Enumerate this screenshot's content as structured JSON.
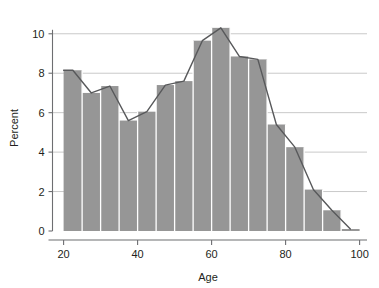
{
  "chart_data": {
    "type": "bar",
    "title": "",
    "subtitle": "",
    "xlabel": "Age",
    "ylabel": "Percent",
    "xlim": [
      17,
      102
    ],
    "ylim": [
      0,
      10.8
    ],
    "grid": true,
    "legend_position": "none",
    "bin_width": 5,
    "bin_edges": [
      20,
      25,
      30,
      35,
      40,
      45,
      50,
      55,
      60,
      65,
      70,
      75,
      80,
      85,
      90,
      95,
      100
    ],
    "categories": [
      "20-25",
      "25-30",
      "30-35",
      "35-40",
      "40-45",
      "45-50",
      "50-55",
      "55-60",
      "60-65",
      "65-70",
      "70-75",
      "75-80",
      "80-85",
      "85-90",
      "90-95",
      "95-100"
    ],
    "x": [
      22.5,
      27.5,
      32.5,
      37.5,
      42.5,
      47.5,
      52.5,
      57.5,
      62.5,
      67.5,
      72.5,
      77.5,
      82.5,
      87.5,
      92.5,
      97.5
    ],
    "values": [
      8.15,
      7.0,
      7.35,
      5.6,
      6.05,
      7.4,
      7.6,
      9.65,
      10.3,
      8.85,
      8.7,
      5.4,
      4.25,
      2.1,
      1.05,
      0.1
    ],
    "series": [
      {
        "name": "Percent",
        "type": "bar",
        "values": [
          8.15,
          7.0,
          7.35,
          5.6,
          6.05,
          7.4,
          7.6,
          9.65,
          10.3,
          8.85,
          8.7,
          5.4,
          4.25,
          2.1,
          1.05,
          0.1
        ]
      },
      {
        "name": "Frequency polygon",
        "type": "line",
        "x": [
          20.0,
          22.5,
          27.5,
          32.5,
          37.5,
          42.5,
          47.5,
          52.5,
          57.5,
          62.5,
          67.5,
          72.5,
          77.5,
          82.5,
          87.5,
          92.5,
          97.5
        ],
        "values": [
          8.15,
          8.15,
          7.0,
          7.35,
          5.6,
          6.05,
          7.4,
          7.6,
          9.65,
          10.3,
          8.85,
          8.7,
          5.4,
          4.25,
          2.1,
          1.05,
          0.1
        ]
      }
    ],
    "x_ticks": [
      20,
      40,
      60,
      80,
      100
    ],
    "x_tick_labels": [
      "20",
      "40",
      "60",
      "80",
      "100"
    ],
    "y_ticks": [
      0,
      2,
      4,
      6,
      8,
      10
    ],
    "y_tick_labels": [
      "0",
      "2",
      "4",
      "6",
      "8",
      "10"
    ],
    "colors": {
      "bar_fill": "#969696",
      "bar_separator": "#ffffff",
      "line": "#58595b",
      "grid": "#c9c9c9",
      "axis": "#6d6e71",
      "text": "#231f20",
      "background": "#ffffff"
    }
  }
}
